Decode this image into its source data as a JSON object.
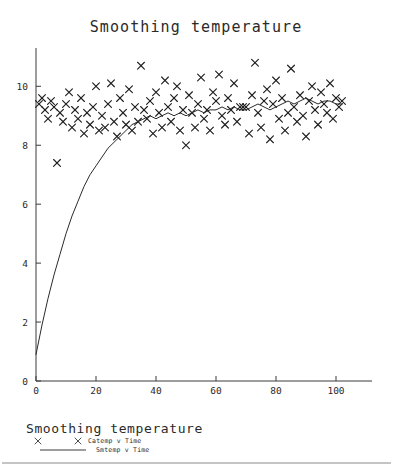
{
  "chart_data": {
    "type": "scatter",
    "title": "Smoothing temperature",
    "xlabel": "",
    "ylabel": "",
    "xlim": [
      0,
      112
    ],
    "ylim": [
      0,
      11.3
    ],
    "grid": false,
    "xticks": [
      0,
      20,
      40,
      60,
      80,
      100
    ],
    "xtick_labels": [
      "0",
      "20",
      "40",
      "60",
      "80",
      "100"
    ],
    "yticks": [
      0,
      2,
      4,
      6,
      8,
      10
    ],
    "ytick_labels": [
      "0",
      "2",
      "4",
      "6",
      "8",
      "10"
    ],
    "legend_position": "below-plot",
    "legend_title": "Smoothing temperature",
    "series": [
      {
        "name": "Catemp v Time",
        "type": "scatter",
        "marker": "x",
        "color": "#1f1f1f",
        "x": [
          1,
          2,
          3,
          4,
          5,
          6,
          7,
          8,
          9,
          10,
          11,
          12,
          13,
          14,
          15,
          16,
          17,
          18,
          19,
          20,
          21,
          22,
          23,
          24,
          25,
          26,
          27,
          28,
          29,
          30,
          31,
          32,
          33,
          34,
          35,
          36,
          37,
          38,
          39,
          40,
          41,
          42,
          43,
          44,
          45,
          46,
          47,
          48,
          49,
          50,
          51,
          52,
          53,
          54,
          55,
          56,
          57,
          58,
          59,
          60,
          61,
          62,
          63,
          64,
          65,
          66,
          67,
          68,
          69,
          70,
          71,
          72,
          73,
          74,
          75,
          76,
          77,
          78,
          79,
          80,
          81,
          82,
          83,
          84,
          85,
          86,
          87,
          88,
          89,
          90,
          91,
          92,
          93,
          94,
          95,
          96,
          97,
          98,
          99,
          100,
          101,
          102
        ],
        "y": [
          9.4,
          9.6,
          9.2,
          8.9,
          9.5,
          9.3,
          7.4,
          9.1,
          8.8,
          9.4,
          9.8,
          8.6,
          9.2,
          8.9,
          9.6,
          8.4,
          9.1,
          8.7,
          9.3,
          10.0,
          8.5,
          9.0,
          8.6,
          9.4,
          10.1,
          8.8,
          8.3,
          9.6,
          9.1,
          8.7,
          9.9,
          8.5,
          9.3,
          8.8,
          10.7,
          9.2,
          8.9,
          9.5,
          8.4,
          9.8,
          9.1,
          8.6,
          10.2,
          9.3,
          8.8,
          9.6,
          10.0,
          8.5,
          9.2,
          8.0,
          9.7,
          9.1,
          8.6,
          9.4,
          10.3,
          8.9,
          9.2,
          8.5,
          9.8,
          9.5,
          10.4,
          9.0,
          8.7,
          9.6,
          9.2,
          10.1,
          8.8,
          9.3,
          9.3,
          9.3,
          8.4,
          9.7,
          10.8,
          9.1,
          8.6,
          9.5,
          9.9,
          8.2,
          9.4,
          10.2,
          8.9,
          9.6,
          8.5,
          9.1,
          10.6,
          9.3,
          8.8,
          9.7,
          9.0,
          8.3,
          9.5,
          10.0,
          9.2,
          8.7,
          9.8,
          9.4,
          9.1,
          10.1,
          8.9,
          9.6,
          9.3,
          9.5
        ]
      },
      {
        "name": "Smtemp v Time",
        "type": "line",
        "marker": "none",
        "color": "#2b2b2b",
        "x": [
          0,
          2,
          4,
          6,
          8,
          10,
          12,
          14,
          16,
          18,
          20,
          22,
          24,
          26,
          28,
          30,
          32,
          34,
          36,
          38,
          40,
          42,
          44,
          46,
          48,
          50,
          52,
          54,
          56,
          58,
          60,
          62,
          64,
          66,
          68,
          70,
          72,
          74,
          76,
          78,
          80,
          82,
          84,
          86,
          88,
          90,
          92,
          94,
          96,
          98,
          100,
          102
        ],
        "y": [
          0.9,
          1.9,
          2.8,
          3.6,
          4.3,
          5.0,
          5.6,
          6.1,
          6.6,
          7.0,
          7.3,
          7.6,
          7.9,
          8.1,
          8.3,
          8.5,
          8.7,
          8.8,
          8.9,
          9.0,
          8.9,
          9.0,
          9.1,
          9.0,
          9.1,
          9.0,
          9.1,
          9.2,
          9.1,
          9.2,
          9.2,
          9.3,
          9.2,
          9.3,
          9.2,
          9.2,
          9.3,
          9.4,
          9.3,
          9.2,
          9.3,
          9.4,
          9.5,
          9.4,
          9.5,
          9.6,
          9.5,
          9.4,
          9.5,
          9.5,
          9.4,
          9.4
        ]
      }
    ]
  },
  "legend": {
    "title": "Smoothing temperature",
    "entries": [
      {
        "label": "Catemp v Time",
        "glyph": "x-marker"
      },
      {
        "label": "Smtemp v Time",
        "glyph": "line-segment"
      }
    ]
  },
  "colors": {
    "background": "#ffffff",
    "ink": "#2a2a2a",
    "axis": "#3a3a3a",
    "rule": "#8a8a8a"
  }
}
